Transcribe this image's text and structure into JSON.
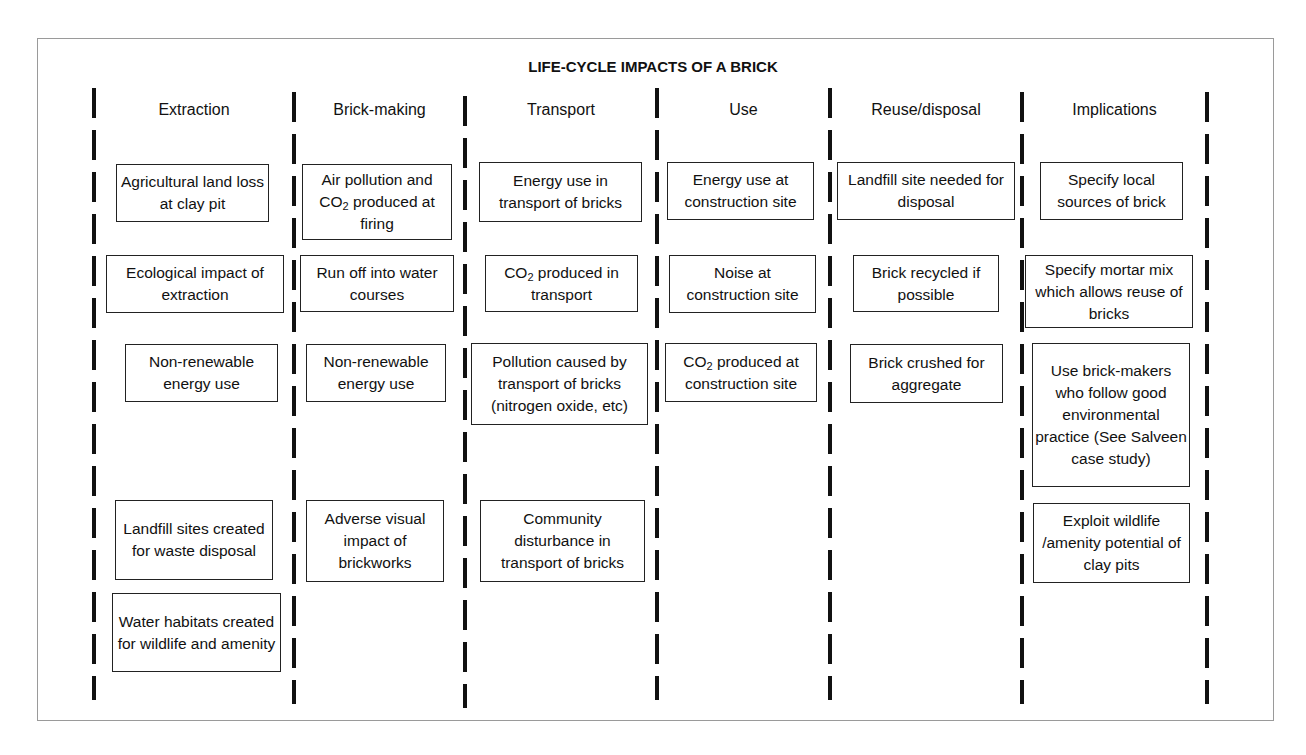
{
  "title": "LIFE-CYCLE IMPACTS OF A BRICK",
  "columns": [
    {
      "header": "Extraction",
      "items": [
        "Agricultural land loss at clay pit",
        "Ecological impact of extraction",
        "Non-renewable energy use",
        "Landfill sites created for waste disposal",
        "Water habitats created for wildlife and amenity"
      ]
    },
    {
      "header": "Brick-making",
      "items": [
        "Air pollution and CO2 produced at firing",
        "Run off into water courses",
        "Non-renewable energy use",
        "Adverse visual impact of brickworks"
      ]
    },
    {
      "header": "Transport",
      "items": [
        "Energy use in transport of bricks",
        "CO2 produced in transport",
        "Pollution caused by transport of bricks (nitrogen oxide, etc)",
        "Community disturbance in transport of bricks"
      ]
    },
    {
      "header": "Use",
      "items": [
        "Energy use at construction site",
        "Noise at construction site",
        "CO2 produced at construction site"
      ]
    },
    {
      "header": "Reuse/disposal",
      "items": [
        "Landfill site needed for disposal",
        "Brick recycled if possible",
        "Brick crushed for aggregate"
      ]
    },
    {
      "header": "Implications",
      "items": [
        "Specify local sources of brick",
        "Specify mortar mix which allows reuse of bricks",
        "Use brick-makers who follow good environmental practice (See Salveen case study)",
        "Exploit wildlife /amenity potential of clay pits"
      ]
    }
  ],
  "colors": {
    "line": "#111111",
    "frame": "#9a9a9a",
    "background": "#ffffff"
  }
}
